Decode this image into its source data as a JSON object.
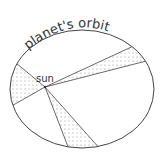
{
  "title": "planet's orbit",
  "sun_label": "sun",
  "colors": {
    "line": "#444444",
    "dots": "#777777",
    "background": "#ffffff"
  },
  "diagram": {
    "ellipse": {
      "cx": 82,
      "cy": 89,
      "rx": 72,
      "ry": 59
    },
    "sun": {
      "x": 45,
      "y": 87
    },
    "shaded_sectors": 3
  }
}
